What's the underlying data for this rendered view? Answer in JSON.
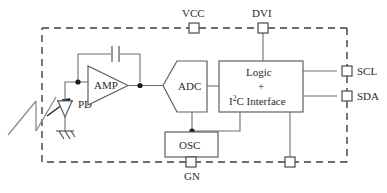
{
  "diagram": {
    "package_boundary": {
      "name": "dashed-package-outline",
      "style": "dashed"
    },
    "blocks": [
      {
        "id": "amp",
        "label": "AMP",
        "shape": "triangle"
      },
      {
        "id": "adc",
        "label": "ADC",
        "shape": "pentagon"
      },
      {
        "id": "logic",
        "label_line1": "Logic",
        "label_plus": "+",
        "label_line2_pre": "I",
        "label_line2_sup": "2",
        "label_line2_post": "C Interface",
        "shape": "rectangle"
      },
      {
        "id": "osc",
        "label": "OSC",
        "shape": "rectangle"
      }
    ],
    "components": [
      {
        "id": "pd",
        "label": "PD",
        "type": "photodiode"
      },
      {
        "id": "cfb",
        "label": "",
        "type": "capacitor"
      },
      {
        "id": "gnd",
        "label": "",
        "type": "ground-symbol"
      },
      {
        "id": "light",
        "label": "",
        "type": "light-input-arrow"
      }
    ],
    "pads": [
      {
        "id": "vcc",
        "label": "VCC",
        "edge": "top",
        "label_position": "above"
      },
      {
        "id": "dvi",
        "label": "DVI",
        "edge": "top",
        "label_position": "above"
      },
      {
        "id": "scl",
        "label": "SCL",
        "edge": "right",
        "label_position": "right"
      },
      {
        "id": "sda",
        "label": "SDA",
        "edge": "right",
        "label_position": "right"
      },
      {
        "id": "gn",
        "label": "GN",
        "edge": "bottom",
        "label_position": "below"
      },
      {
        "id": "unlabeled-bottom",
        "label": "",
        "edge": "bottom",
        "label_position": "none"
      }
    ],
    "colors": {
      "background": "#ffffff",
      "wire": "#6f6f6f",
      "block_outline": "#5f5f5f",
      "boundary": "#3f3f3f",
      "text": "#2b2b2b",
      "junction_dot": "#1a1a1a"
    }
  }
}
